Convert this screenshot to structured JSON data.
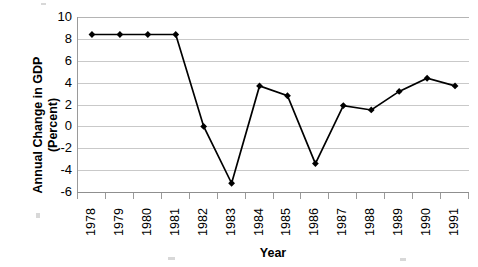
{
  "chart_data": {
    "type": "line",
    "title": "",
    "xlabel": "Year",
    "ylabel": "Annual Change in GDP (Percent)",
    "ylabel_line1": "Annual Change in GDP",
    "ylabel_line2": "(Percent)",
    "categories": [
      "1978",
      "1979",
      "1980",
      "1981",
      "1982",
      "1983",
      "1984",
      "1985",
      "1986",
      "1987",
      "1988",
      "1989",
      "1990",
      "1991"
    ],
    "values": [
      8.4,
      8.4,
      8.4,
      8.4,
      0.0,
      -5.2,
      3.7,
      2.8,
      -3.4,
      1.9,
      1.5,
      3.2,
      4.4,
      3.7
    ],
    "series": [
      {
        "name": "Annual Change in GDP",
        "values": [
          8.4,
          8.4,
          8.4,
          8.4,
          0.0,
          -5.2,
          3.7,
          2.8,
          -3.4,
          1.9,
          1.5,
          3.2,
          4.4,
          3.7
        ]
      }
    ],
    "ylim": [
      -6,
      10
    ],
    "yticks": [
      10,
      8,
      6,
      4,
      2,
      0,
      -2,
      -4,
      -6
    ],
    "ytick_labels": [
      "10",
      "8",
      "6",
      "4",
      "2",
      "0",
      "-2",
      "-4",
      "-6"
    ],
    "grid": true,
    "grid_axis": "y",
    "legend": false,
    "legend_position": "none",
    "marker": "diamond",
    "marker_color": "#000000",
    "line_color": "#000000",
    "gridline_color": "#c9c9c9",
    "axis_color": "#8f8f8f",
    "background_color": "#ffffff"
  }
}
